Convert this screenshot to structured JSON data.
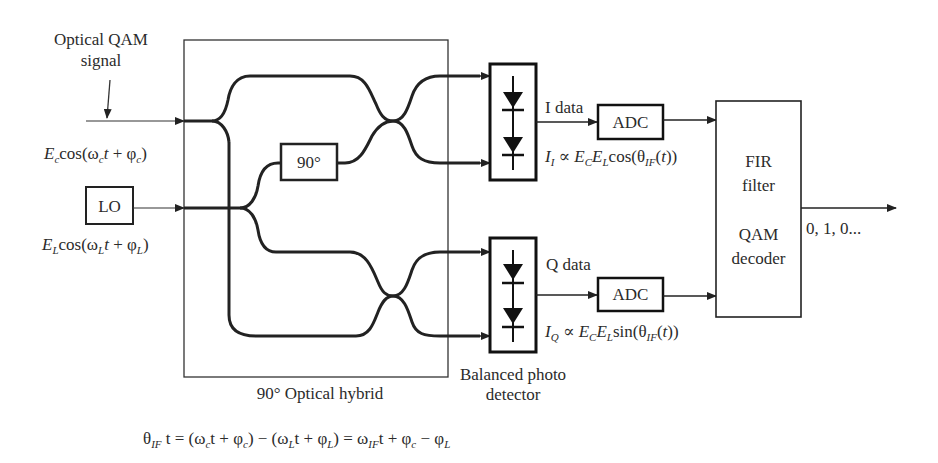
{
  "diagram": {
    "inputs": {
      "signal_label_line1": "Optical QAM",
      "signal_label_line2": "signal",
      "signal_field": {
        "amp": "E",
        "amp_sub": "c",
        "func": "cos(",
        "omega": "ω",
        "omega_sub": "c",
        "t": "t",
        "plus": " + ",
        "phi": "φ",
        "phi_sub": "c",
        "close": ")"
      },
      "lo_label": "LO",
      "lo_field": {
        "amp": "E",
        "amp_sub": "L",
        "func": "cos(",
        "omega": "ω",
        "omega_sub": "L",
        "t": "t",
        "plus": " + ",
        "phi": "φ",
        "phi_sub": "L",
        "close": ")"
      }
    },
    "hybrid": {
      "phase_shifter_label": "90°",
      "caption": "90° Optical hybrid"
    },
    "detectors": {
      "caption_line1": "Balanced photo",
      "caption_line2": "detector",
      "i_branch": {
        "data_label": "I data",
        "adc_label": "ADC",
        "current": {
          "I": "I",
          "I_sub": "I",
          "prop": " ∝ ",
          "Ec": "E",
          "Ec_sub": "C",
          "El": "E",
          "El_sub": "L",
          "func": "cos(θ",
          "theta_sub": "IF",
          "open": "(",
          "t": "t",
          "close": "))"
        }
      },
      "q_branch": {
        "data_label": "Q data",
        "adc_label": "ADC",
        "current": {
          "I": "I",
          "I_sub": "Q",
          "prop": " ∝ ",
          "Ec": "E",
          "Ec_sub": "C",
          "El": "E",
          "El_sub": "L",
          "func": "sin(θ",
          "theta_sub": "IF",
          "open": "(",
          "t": "t",
          "close": "))"
        }
      }
    },
    "decoder": {
      "line1": "FIR",
      "line2": "filter",
      "line3": "QAM",
      "line4": "decoder",
      "output_label": "0, 1, 0..."
    },
    "equation": {
      "theta": "θ",
      "theta_sub": "IF",
      "part1": " t = (ω",
      "wc_sub": "c",
      "part2": "t + φ",
      "pc_sub": "c",
      "part3": ") − (ω",
      "wl_sub": "L",
      "part4": "t + φ",
      "pl_sub": "L",
      "part5": ") = ω",
      "wif_sub": "IF",
      "part6": "t + φ",
      "pc2_sub": "c",
      "part7": " − φ",
      "pl2_sub": "L"
    }
  }
}
